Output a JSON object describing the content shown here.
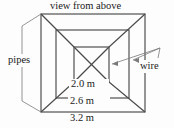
{
  "figure": {
    "title": "view from above",
    "labels": {
      "pipes": "pipes",
      "wire": "wire"
    },
    "dimensions": [
      {
        "name": "inner-square",
        "text": "2.0 m"
      },
      {
        "name": "middle-square",
        "text": "2.6 m"
      },
      {
        "name": "outer-square",
        "text": "3.2 m"
      }
    ],
    "colors": {
      "line": "#4a4a4a",
      "leader": "#7a7a7a",
      "text": "#1a1a1a",
      "background": "#fdfdfd"
    }
  }
}
